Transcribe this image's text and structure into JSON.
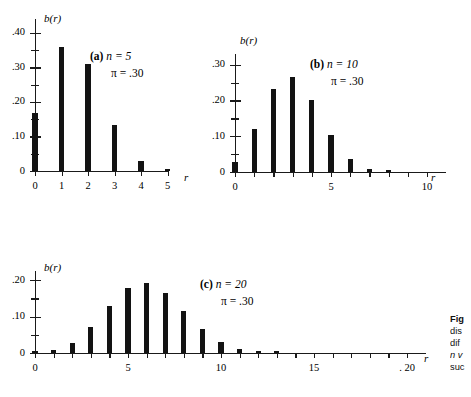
{
  "figure": {
    "axis_label_y": "b(r)",
    "axis_label_x": "r",
    "pi_symbol": "π"
  },
  "caption": {
    "line1_bold": "Fig",
    "line2": "dis",
    "line3": "dif",
    "line4": "n v",
    "line5": "suc",
    "line6": "is c"
  },
  "chart_data": [
    {
      "type": "bar",
      "panel": "a",
      "panel_letter": "(a)",
      "title": "",
      "annotation_n": "n = 5",
      "annotation_pi": "π = .30",
      "n": 5,
      "pi": 0.3,
      "xlabel": "r",
      "ylabel": "b(r)",
      "categories": [
        0,
        1,
        2,
        3,
        4,
        5
      ],
      "values": [
        0.168,
        0.36,
        0.309,
        0.132,
        0.028,
        0.002
      ],
      "xlim": [
        0,
        5
      ],
      "ylim": [
        0,
        0.44
      ],
      "xticks": [
        0,
        1,
        2,
        3,
        4,
        5
      ],
      "xticklabels": [
        "0",
        "1",
        "2",
        "3",
        "4",
        "5"
      ],
      "yticks": [
        0,
        0.1,
        0.2,
        0.3,
        0.4
      ],
      "yticklabels": [
        "0",
        ".10",
        ".20",
        ".30",
        ".40"
      ],
      "yminorticks": [
        0.05,
        0.15,
        0.25,
        0.35
      ],
      "grid": false,
      "legend": "none"
    },
    {
      "type": "bar",
      "panel": "b",
      "panel_letter": "(b)",
      "title": "",
      "annotation_n": "n = 10",
      "annotation_pi": "π = .30",
      "n": 10,
      "pi": 0.3,
      "xlabel": "r",
      "ylabel": "b(r)",
      "categories": [
        0,
        1,
        2,
        3,
        4,
        5,
        6,
        7,
        8,
        9,
        10
      ],
      "values": [
        0.028,
        0.121,
        0.233,
        0.267,
        0.2,
        0.103,
        0.037,
        0.009,
        0.001,
        0.0,
        0.0
      ],
      "xlim": [
        0,
        11
      ],
      "ylim": [
        0,
        0.33
      ],
      "xticks": [
        0,
        1,
        2,
        3,
        4,
        5,
        6,
        7,
        8,
        9,
        10
      ],
      "xticklabels": [
        "0",
        "",
        "",
        "",
        "",
        "5",
        "",
        "",
        "",
        "",
        "10"
      ],
      "yticks": [
        0,
        0.1,
        0.2,
        0.3
      ],
      "yticklabels": [
        "0",
        ".10",
        ".20",
        ".30"
      ],
      "yminorticks": [
        0.05,
        0.15,
        0.25
      ],
      "grid": false,
      "legend": "none"
    },
    {
      "type": "bar",
      "panel": "c",
      "panel_letter": "(c)",
      "title": "",
      "annotation_n": "n = 20",
      "annotation_pi": "π = .30",
      "n": 20,
      "pi": 0.3,
      "xlabel": "r",
      "ylabel": "b(r)",
      "categories": [
        0,
        1,
        2,
        3,
        4,
        5,
        6,
        7,
        8,
        9,
        10,
        11,
        12,
        13,
        14,
        15,
        16,
        17,
        18,
        19,
        20
      ],
      "values": [
        0.001,
        0.007,
        0.028,
        0.072,
        0.13,
        0.179,
        0.192,
        0.164,
        0.114,
        0.065,
        0.031,
        0.012,
        0.004,
        0.001,
        0.0,
        0.0,
        0.0,
        0.0,
        0.0,
        0.0,
        0.0
      ],
      "xlim": [
        0,
        21
      ],
      "ylim": [
        0,
        0.225
      ],
      "xticks": [
        0,
        1,
        2,
        3,
        4,
        5,
        6,
        7,
        8,
        9,
        10,
        11,
        12,
        13,
        14,
        15,
        16,
        17,
        18,
        19,
        20
      ],
      "xticklabels": [
        "0",
        "",
        "",
        "",
        "",
        "5",
        "",
        "",
        "",
        "",
        "10",
        "",
        "",
        "",
        "",
        "15",
        "",
        "",
        "",
        "",
        ". 20"
      ],
      "yticks": [
        0,
        0.1,
        0.2
      ],
      "yticklabels": [
        "0",
        ".10",
        ".20"
      ],
      "yminorticks": [
        0.05,
        0.15
      ],
      "grid": false,
      "legend": "none"
    }
  ]
}
